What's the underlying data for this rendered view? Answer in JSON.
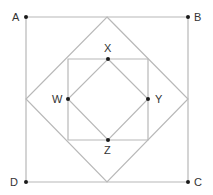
{
  "diagram": {
    "colors": {
      "line": "#b8b8b8",
      "point": "#1a1a1a",
      "label": "#333333"
    },
    "points": [
      {
        "id": "A",
        "label": "A"
      },
      {
        "id": "B",
        "label": "B"
      },
      {
        "id": "C",
        "label": "C"
      },
      {
        "id": "D",
        "label": "D"
      },
      {
        "id": "X",
        "label": "X"
      },
      {
        "id": "Y",
        "label": "Y"
      },
      {
        "id": "Z",
        "label": "Z"
      },
      {
        "id": "W",
        "label": "W"
      }
    ],
    "shapes": [
      {
        "name": "square-ABCD",
        "vertices": [
          "A",
          "B",
          "C",
          "D"
        ]
      },
      {
        "name": "midpoint-square-of-ABCD",
        "vertices": [
          "mid-AB",
          "mid-BC",
          "mid-CD",
          "mid-DA"
        ]
      },
      {
        "name": "inner-square",
        "vertices": [
          "corner-XW",
          "corner-XY",
          "corner-YZ",
          "corner-ZW"
        ]
      },
      {
        "name": "square-WXYZ",
        "vertices": [
          "X",
          "Y",
          "Z",
          "W"
        ]
      }
    ]
  }
}
